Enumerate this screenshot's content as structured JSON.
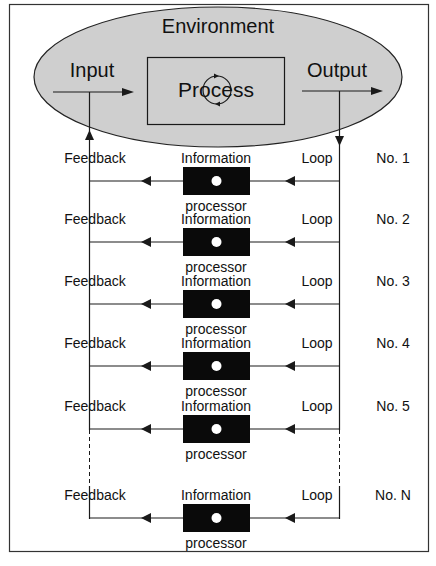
{
  "diagram": {
    "environment": {
      "label": "Environment",
      "fill": "#cfcfcf"
    },
    "input": {
      "label": "Input"
    },
    "process": {
      "label": "Process"
    },
    "output": {
      "label": "Output"
    },
    "loops": [
      {
        "feedback": "Feedback",
        "info": "Information",
        "loop": "Loop",
        "number": "No. 1",
        "processor": "processor"
      },
      {
        "feedback": "Feedback",
        "info": "Information",
        "loop": "Loop",
        "number": "No. 2",
        "processor": "processor"
      },
      {
        "feedback": "Feedback",
        "info": "Information",
        "loop": "Loop",
        "number": "No. 3",
        "processor": "processor"
      },
      {
        "feedback": "Feedback",
        "info": "Information",
        "loop": "Loop",
        "number": "No. 4",
        "processor": "processor"
      },
      {
        "feedback": "Feedback",
        "info": "Information",
        "loop": "Loop",
        "number": "No. 5",
        "processor": "processor"
      },
      {
        "feedback": "Feedback",
        "info": "Information",
        "loop": "Loop",
        "number": "No. N",
        "processor": "processor"
      }
    ],
    "colors": {
      "line": "#1a1a1a",
      "processor_box": "#0a0a0a",
      "processor_dot": "#ffffff"
    }
  }
}
